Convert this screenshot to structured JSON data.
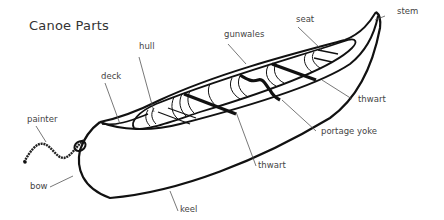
{
  "title": "Canoe Parts",
  "labels": {
    "hull": "hull",
    "deck": "deck",
    "gunwales": "gunwales",
    "seat": "seat",
    "stem": "stem",
    "thwart_right": "thwart",
    "portage_yoke": "portage yoke",
    "thwart_bottom": "thwart",
    "painter": "painter",
    "bow": "bow",
    "keel": "keel"
  },
  "colors": {
    "line": "#111111",
    "leader": "#555555",
    "text": "#444444"
  }
}
